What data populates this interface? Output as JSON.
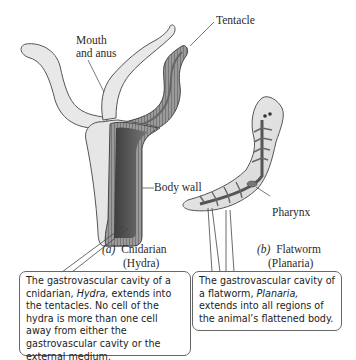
{
  "figure": {
    "labels": {
      "mouth_and_anus_line1": "Mouth",
      "mouth_and_anus_line2": "and anus",
      "tentacle": "Tentacle",
      "body_wall": "Body wall",
      "pharynx": "Pharynx"
    },
    "panel_a": {
      "letter": "(a)",
      "name": "Cnidarian",
      "genus": "(Hydra)"
    },
    "panel_b": {
      "letter": "(b)",
      "name": "Flatworm",
      "genus": "(Planaria)"
    },
    "callout_a": {
      "text_before": "The gastrovascular cavity of a cnidarian, ",
      "italic": "Hydra,",
      "text_after": " extends into the tentacles. No cell of the hydra is more than one cell away from either the gastrovascular cavity or the external medium."
    },
    "callout_b": {
      "text_before": "The gastrovascular cavity of a flatworm, ",
      "italic": "Planaria,",
      "text_after": " extends into all regions of the animal’s flattened body."
    },
    "colors": {
      "ink": "#2a2a2a",
      "outer_tissue": "#e4e4e4",
      "wall": "#8a8a8a",
      "cavity": "#5c5c5c"
    }
  }
}
